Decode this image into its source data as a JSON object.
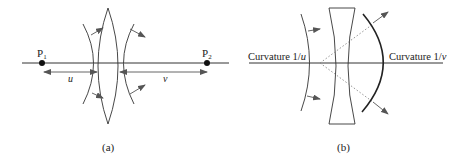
{
  "figure_a": {
    "caption": "(a)",
    "point_1": {
      "label": "P",
      "subscript": "1"
    },
    "point_2": {
      "label": "P",
      "subscript": "2"
    },
    "distance_u": "u",
    "distance_v": "v",
    "lens_type": "convex"
  },
  "figure_b": {
    "caption": "(b)",
    "left_label_prefix": "Curvature 1/",
    "left_label_var": "u",
    "right_label_prefix": "Curvature 1/",
    "right_label_var": "v",
    "lens_type": "concave"
  },
  "colors": {
    "line": "#333333",
    "arrow": "#555555",
    "dotted": "#888888"
  }
}
